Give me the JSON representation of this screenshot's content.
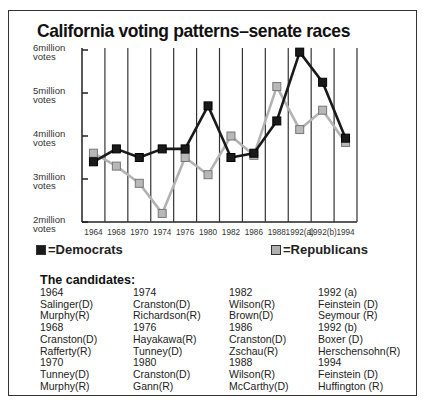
{
  "title": "California voting patterns–senate races",
  "chart_data": {
    "type": "line",
    "title": "California voting patterns–senate races",
    "xlabel": "",
    "ylabel": "votes",
    "categories": [
      "1964",
      "1968",
      "1970",
      "1974",
      "1976",
      "1980",
      "1982",
      "1986",
      "1988",
      "1992(a)",
      "1992(b)",
      "1994"
    ],
    "y_ticks": [
      "6million votes",
      "5million votes",
      "4million votes",
      "3million votes",
      "2million votes"
    ],
    "ylim": [
      2,
      6
    ],
    "grid": "vertical lines between categories",
    "legend_position": "bottom",
    "series": [
      {
        "name": "=Democrats",
        "color": "#1a1a1a",
        "marker": "filled black square",
        "values": [
          3.4,
          3.7,
          3.5,
          3.7,
          3.7,
          4.7,
          3.5,
          3.6,
          4.35,
          5.95,
          5.25,
          3.95
        ]
      },
      {
        "name": "=Republicans",
        "color": "#aaaaaa",
        "marker": "gray square",
        "values": [
          3.6,
          3.3,
          2.9,
          2.2,
          3.5,
          3.1,
          4.0,
          3.55,
          5.15,
          4.15,
          4.6,
          3.85
        ]
      }
    ]
  },
  "legend": {
    "dem": "=Democrats",
    "rep": "=Republicans"
  },
  "candidates": {
    "title": "The candidates:",
    "columns": [
      [
        "1964",
        "Salinger(D)",
        "Murphy(R)",
        "1968",
        "Cranston(D)",
        "Rafferty(R)",
        "1970",
        "Tunney(D)",
        "Murphy(R)"
      ],
      [
        "1974",
        "Cranston(D)",
        "Richardson(R)",
        "1976",
        "Hayakawa(R)",
        "Tunney(D)",
        "1980",
        "Cranston(D)",
        "Gann(R)"
      ],
      [
        "1982",
        "Wilson(R)",
        "Brown(D)",
        "1986",
        "Cranston(D)",
        "Zschau(R)",
        "1988",
        "Wilson(R)",
        "McCarthy(D)"
      ],
      [
        "1992 (a)",
        "Feinstein (D)",
        "Seymour (R)",
        "1992 (b)",
        "Boxer (D)",
        "Herschensohn(R)",
        "1994",
        "Feinstein (D)",
        "Huffington (R)"
      ]
    ]
  }
}
